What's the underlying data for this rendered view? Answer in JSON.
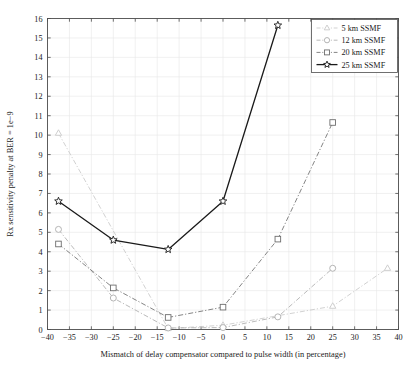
{
  "chart_data": {
    "type": "line",
    "title": "",
    "xlabel": "Mismatch of delay compensator compared to pulse width (in percentage)",
    "ylabel": "Rx sensitivity penalty at BER = 1e−9",
    "xlim": [
      -40,
      40
    ],
    "ylim": [
      0,
      16
    ],
    "xticks": [
      -40,
      -35,
      -30,
      -25,
      -20,
      -15,
      -10,
      -5,
      0,
      5,
      10,
      15,
      20,
      25,
      30,
      35,
      40
    ],
    "xtick_labels": [
      "−40",
      "−35",
      "−30",
      "−25",
      "−20",
      "−15",
      "−10",
      "−5",
      "0",
      "5",
      "10",
      "15",
      "20",
      "25",
      "30",
      "35",
      "40"
    ],
    "yticks": [
      0,
      1,
      2,
      3,
      4,
      5,
      6,
      7,
      8,
      9,
      10,
      11,
      12,
      13,
      14,
      15,
      16
    ],
    "ytick_labels": [
      "0",
      "1",
      "2",
      "3",
      "4",
      "5",
      "6",
      "7",
      "8",
      "9",
      "10",
      "11",
      "12",
      "13",
      "14",
      "15",
      "16"
    ],
    "grid": true,
    "legend_position": "top-right",
    "series": [
      {
        "name": "5 km SSMF",
        "marker": "triangle",
        "linestyle": "dashdot",
        "color": "#c9c9c9",
        "points": [
          {
            "x": -37.5,
            "y": 10.1
          },
          {
            "x": -12.5,
            "y": 0.05
          },
          {
            "x": 0.0,
            "y": 0.22
          },
          {
            "x": 25.0,
            "y": 1.2
          },
          {
            "x": 37.5,
            "y": 3.15
          }
        ]
      },
      {
        "name": "12 km SSMF",
        "marker": "circle",
        "linestyle": "dashdot",
        "color": "#adadad",
        "points": [
          {
            "x": -37.5,
            "y": 5.15
          },
          {
            "x": -25.0,
            "y": 1.62
          },
          {
            "x": -12.5,
            "y": 0.08
          },
          {
            "x": 0.0,
            "y": 0.1
          },
          {
            "x": 12.5,
            "y": 0.65
          },
          {
            "x": 25.0,
            "y": 3.15
          }
        ]
      },
      {
        "name": "20 km SSMF",
        "marker": "square",
        "linestyle": "dashdot",
        "color": "#6e6e6e",
        "points": [
          {
            "x": -37.5,
            "y": 4.4
          },
          {
            "x": -25.0,
            "y": 2.14
          },
          {
            "x": -12.5,
            "y": 0.62
          },
          {
            "x": 0.0,
            "y": 1.15
          },
          {
            "x": 12.5,
            "y": 4.65
          },
          {
            "x": 25.0,
            "y": 10.65
          }
        ]
      },
      {
        "name": "25 km SSMF",
        "marker": "star",
        "linestyle": "solid",
        "color": "#1a1a1a",
        "points": [
          {
            "x": -37.5,
            "y": 6.6
          },
          {
            "x": -25.0,
            "y": 4.6
          },
          {
            "x": -12.5,
            "y": 4.12
          },
          {
            "x": 0.0,
            "y": 6.6
          },
          {
            "x": 12.5,
            "y": 15.65
          }
        ]
      }
    ]
  },
  "legend": {
    "entries": [
      {
        "label": "5 km SSMF"
      },
      {
        "label": "12 km SSMF"
      },
      {
        "label": "20 km SSMF"
      },
      {
        "label": "25 km SSMF"
      }
    ]
  },
  "style": {
    "grid_color": "#e8e8e8",
    "axis_color": "#4d4d4d",
    "background": "#ffffff"
  }
}
